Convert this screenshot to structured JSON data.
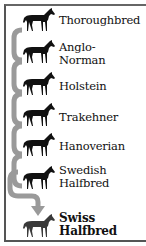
{
  "diagram": {
    "colors": {
      "horse": "#111111",
      "final_horse": "#3a3a3a",
      "connector": "#9a9a9a",
      "frame": "#555555"
    },
    "breeds": [
      {
        "line1": "Thoroughbred",
        "line2": "",
        "icon": "horse-icon"
      },
      {
        "line1": "Anglo-",
        "line2": "Norman",
        "icon": "horse-icon"
      },
      {
        "line1": "Holstein",
        "line2": "",
        "icon": "horse-icon"
      },
      {
        "line1": "Trakehner",
        "line2": "",
        "icon": "horse-icon"
      },
      {
        "line1": "Hanoverian",
        "line2": "",
        "icon": "horse-icon"
      },
      {
        "line1": "Swedish",
        "line2": "Halfbred",
        "icon": "horse-icon"
      }
    ],
    "result": {
      "line1": "Swiss",
      "line2": "Halfbred",
      "icon": "horse-icon"
    }
  }
}
